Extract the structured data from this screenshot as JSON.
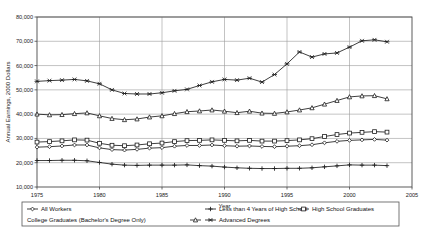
{
  "chart_data": {
    "type": "line",
    "title": "",
    "xlabel": "Year",
    "ylabel": "Annual Earnings, 2000 Dollars",
    "xlim": [
      1975,
      2005
    ],
    "ylim": [
      10000,
      80000
    ],
    "xticks": [
      "1975",
      "1980",
      "1985",
      "1990",
      "1995",
      "2000",
      "2005"
    ],
    "yticks": [
      "10,000",
      "20,000",
      "30,000",
      "40,000",
      "50,000",
      "60,000",
      "70,000",
      "80,000"
    ],
    "grid": true,
    "legend_position": "bottom",
    "x": [
      1975,
      1976,
      1977,
      1978,
      1979,
      1980,
      1981,
      1982,
      1983,
      1984,
      1985,
      1986,
      1987,
      1988,
      1989,
      1990,
      1991,
      1992,
      1993,
      1994,
      1995,
      1996,
      1997,
      1998,
      1999,
      2000,
      2001,
      2002,
      2003
    ],
    "series": [
      {
        "name": "All Workers",
        "marker": "diamond",
        "values": [
          26400,
          26600,
          26900,
          27300,
          27300,
          26100,
          25400,
          25200,
          25500,
          26000,
          26200,
          26800,
          27100,
          27100,
          27300,
          27000,
          26800,
          26900,
          26700,
          26600,
          26800,
          27000,
          27400,
          28200,
          28800,
          29200,
          29400,
          29600,
          29300
        ]
      },
      {
        "name": "Less than 4 Years of High School",
        "marker": "plus",
        "values": [
          20900,
          20900,
          21000,
          21000,
          20800,
          20100,
          19400,
          19000,
          18900,
          19000,
          19000,
          19000,
          19100,
          18800,
          18600,
          18200,
          17900,
          17700,
          17600,
          17600,
          17700,
          17700,
          17900,
          18300,
          18700,
          19100,
          19000,
          19000,
          18800
        ]
      },
      {
        "name": "High School Graduates",
        "marker": "square",
        "values": [
          28500,
          28700,
          29000,
          29400,
          29300,
          28000,
          27200,
          27000,
          27300,
          27800,
          28100,
          28700,
          29100,
          29200,
          29400,
          29200,
          29000,
          29200,
          28900,
          28900,
          29100,
          29400,
          29900,
          30800,
          31600,
          32200,
          32500,
          32800,
          32600
        ]
      },
      {
        "name": "College Graduates (Bachelor's Degree Only)",
        "marker": "triangle",
        "values": [
          40000,
          39700,
          39800,
          40200,
          40500,
          39300,
          38200,
          37700,
          38000,
          38800,
          39300,
          40200,
          41000,
          41300,
          41700,
          41200,
          40600,
          41200,
          40400,
          40300,
          40900,
          41700,
          42600,
          44100,
          45600,
          47100,
          47500,
          47600,
          46300
        ]
      },
      {
        "name": "Advanced Degrees",
        "marker": "cross",
        "values": [
          53500,
          53800,
          54000,
          54300,
          53700,
          52500,
          50000,
          48500,
          48300,
          48300,
          48800,
          49600,
          50200,
          51800,
          53300,
          54300,
          54000,
          54800,
          53200,
          56300,
          60700,
          65600,
          63500,
          64800,
          65200,
          67600,
          70200,
          70600,
          69800
        ]
      }
    ]
  }
}
